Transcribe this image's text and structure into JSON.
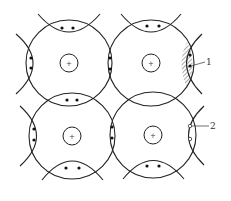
{
  "diagram": {
    "type": "covalent-bond-lattice",
    "colors": {
      "stroke": "#222222",
      "hatch": "#555555",
      "background": "#ffffff"
    },
    "atoms": [
      {
        "id": "atom-top-left",
        "cx": 69,
        "cy": 63,
        "r": 43,
        "nucleus_r": 9,
        "nucleus_label": "+"
      },
      {
        "id": "atom-top-right",
        "cx": 151,
        "cy": 63,
        "r": 43,
        "nucleus_r": 9,
        "nucleus_label": "+"
      },
      {
        "id": "atom-bottom-left",
        "cx": 72,
        "cy": 136,
        "r": 43,
        "nucleus_r": 9,
        "nucleus_label": "+"
      },
      {
        "id": "atom-bottom-right",
        "cx": 153,
        "cy": 135,
        "r": 43,
        "nucleus_r": 9,
        "nucleus_label": "+"
      }
    ],
    "callouts": [
      {
        "label": "1",
        "description": "shaded bond region (electron pair)"
      },
      {
        "label": "2",
        "description": "hollow circles (holes)"
      }
    ]
  }
}
